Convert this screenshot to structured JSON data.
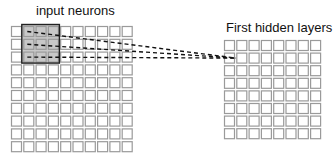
{
  "labels": {
    "input": "input neurons",
    "hidden": "First hidden layers"
  },
  "input_grid": {
    "cols": 10,
    "rows": 10,
    "x": 11,
    "y": 26,
    "pitch_x": 12.3,
    "pitch_y": 12.8,
    "cell": 10
  },
  "hidden_grid": {
    "cols": 8,
    "rows": 8,
    "x": 224,
    "y": 40,
    "pitch_x": 12.3,
    "pitch_y": 12.6,
    "cell": 10
  },
  "receptive_field": {
    "col": 1,
    "row": 0,
    "size": 3
  },
  "target_neuron": {
    "col": 0,
    "row": 1
  },
  "colors": {
    "cell_border": "#9a9a9a",
    "highlight_fill": "#c8c8c8",
    "highlight_border": "#222222",
    "dashes": "#111111"
  }
}
